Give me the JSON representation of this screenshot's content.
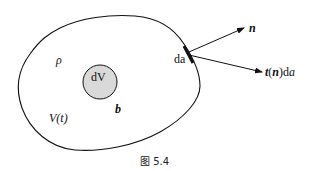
{
  "figure": {
    "caption": "图 5.4",
    "colors": {
      "stroke": "#111111",
      "inner_fill": "#d9d9d9",
      "background": "#ffffff"
    }
  },
  "labels": {
    "density": "ρ",
    "volume": "V(t)",
    "volume_element": "dV",
    "body_force": "b",
    "area_element": "da",
    "normal": "n",
    "traction_t": "t",
    "traction_paren_open": "(",
    "traction_n": "n",
    "traction_paren_close": ")d",
    "traction_a": "a"
  },
  "shapes": {
    "region": "closed blob V(t)",
    "element": "circle dV",
    "surface_patch": "thick segment da",
    "arrows": [
      "normal n",
      "traction t(n)da"
    ]
  }
}
